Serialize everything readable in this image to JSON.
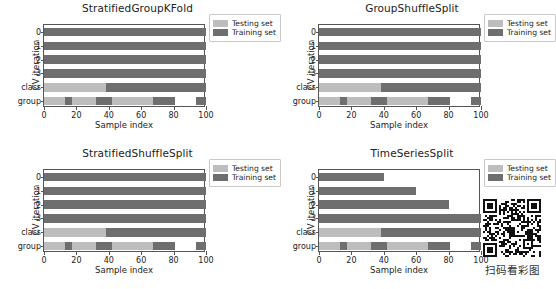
{
  "figure": {
    "background": "#ffffff",
    "colors": {
      "testing": "#bdbdbd",
      "training": "#6e6e6e",
      "axis": "#555555",
      "text": "#222222"
    },
    "legend": {
      "testing_label": "Testing set",
      "training_label": "Training set"
    },
    "axis": {
      "xlabel": "Sample index",
      "ylabel": "CV iteration",
      "xticks": [
        0,
        20,
        40,
        60,
        80,
        100
      ],
      "xticklabels": [
        "0",
        "20",
        "40",
        "60",
        "80",
        "100"
      ],
      "yticklabels": [
        "0",
        "1",
        "2",
        "3",
        "class",
        "group"
      ],
      "xlim": [
        0,
        100
      ]
    }
  },
  "chart_data": [
    {
      "type": "bar",
      "title": "StratifiedGroupKFold",
      "xlabel": "Sample index",
      "ylabel": "CV iteration",
      "xlim": [
        0,
        100
      ],
      "categories": [
        "0",
        "1",
        "2",
        "3",
        "class",
        "group"
      ],
      "rows": [
        {
          "label": "0",
          "segments": [
            {
              "start": 0,
              "end": 100,
              "kind": "train"
            }
          ]
        },
        {
          "label": "1",
          "segments": [
            {
              "start": 0,
              "end": 100,
              "kind": "train"
            }
          ]
        },
        {
          "label": "2",
          "segments": [
            {
              "start": 0,
              "end": 100,
              "kind": "train"
            }
          ]
        },
        {
          "label": "3",
          "segments": [
            {
              "start": 0,
              "end": 100,
              "kind": "train"
            }
          ]
        },
        {
          "label": "class",
          "segments": [
            {
              "start": 0,
              "end": 38,
              "kind": "test"
            },
            {
              "start": 38,
              "end": 100,
              "kind": "train"
            }
          ]
        },
        {
          "label": "group",
          "segments": [
            {
              "start": 0,
              "end": 13,
              "kind": "test"
            },
            {
              "start": 13,
              "end": 17,
              "kind": "train"
            },
            {
              "start": 17,
              "end": 32,
              "kind": "test"
            },
            {
              "start": 32,
              "end": 42,
              "kind": "train"
            },
            {
              "start": 42,
              "end": 67,
              "kind": "test"
            },
            {
              "start": 67,
              "end": 81,
              "kind": "train"
            },
            {
              "start": 81,
              "end": 94,
              "kind": "blank"
            },
            {
              "start": 94,
              "end": 100,
              "kind": "train"
            }
          ]
        }
      ]
    },
    {
      "type": "bar",
      "title": "GroupShuffleSplit",
      "xlabel": "Sample index",
      "ylabel": "CV iteration",
      "xlim": [
        0,
        100
      ],
      "categories": [
        "0",
        "1",
        "2",
        "3",
        "class",
        "group"
      ],
      "rows": [
        {
          "label": "0",
          "segments": [
            {
              "start": 0,
              "end": 100,
              "kind": "train"
            }
          ]
        },
        {
          "label": "1",
          "segments": [
            {
              "start": 0,
              "end": 100,
              "kind": "train"
            }
          ]
        },
        {
          "label": "2",
          "segments": [
            {
              "start": 0,
              "end": 100,
              "kind": "train"
            }
          ]
        },
        {
          "label": "3",
          "segments": [
            {
              "start": 0,
              "end": 100,
              "kind": "train"
            }
          ]
        },
        {
          "label": "class",
          "segments": [
            {
              "start": 0,
              "end": 38,
              "kind": "test"
            },
            {
              "start": 38,
              "end": 100,
              "kind": "train"
            }
          ]
        },
        {
          "label": "group",
          "segments": [
            {
              "start": 0,
              "end": 13,
              "kind": "test"
            },
            {
              "start": 13,
              "end": 17,
              "kind": "train"
            },
            {
              "start": 17,
              "end": 32,
              "kind": "test"
            },
            {
              "start": 32,
              "end": 42,
              "kind": "train"
            },
            {
              "start": 42,
              "end": 67,
              "kind": "test"
            },
            {
              "start": 67,
              "end": 81,
              "kind": "train"
            },
            {
              "start": 81,
              "end": 94,
              "kind": "blank"
            },
            {
              "start": 94,
              "end": 100,
              "kind": "train"
            }
          ]
        }
      ]
    },
    {
      "type": "bar",
      "title": "StratifiedShuffleSplit",
      "xlabel": "Sample index",
      "ylabel": "CV iteration",
      "xlim": [
        0,
        100
      ],
      "categories": [
        "0",
        "1",
        "2",
        "3",
        "class",
        "group"
      ],
      "rows": [
        {
          "label": "0",
          "segments": [
            {
              "start": 0,
              "end": 100,
              "kind": "train"
            }
          ]
        },
        {
          "label": "1",
          "segments": [
            {
              "start": 0,
              "end": 100,
              "kind": "train"
            }
          ]
        },
        {
          "label": "2",
          "segments": [
            {
              "start": 0,
              "end": 100,
              "kind": "train"
            }
          ]
        },
        {
          "label": "3",
          "segments": [
            {
              "start": 0,
              "end": 100,
              "kind": "train"
            }
          ]
        },
        {
          "label": "class",
          "segments": [
            {
              "start": 0,
              "end": 38,
              "kind": "test"
            },
            {
              "start": 38,
              "end": 100,
              "kind": "train"
            }
          ]
        },
        {
          "label": "group",
          "segments": [
            {
              "start": 0,
              "end": 13,
              "kind": "test"
            },
            {
              "start": 13,
              "end": 17,
              "kind": "train"
            },
            {
              "start": 17,
              "end": 32,
              "kind": "test"
            },
            {
              "start": 32,
              "end": 42,
              "kind": "train"
            },
            {
              "start": 42,
              "end": 67,
              "kind": "test"
            },
            {
              "start": 67,
              "end": 81,
              "kind": "train"
            },
            {
              "start": 81,
              "end": 94,
              "kind": "blank"
            },
            {
              "start": 94,
              "end": 100,
              "kind": "train"
            }
          ]
        }
      ]
    },
    {
      "type": "bar",
      "title": "TimeSeriesSplit",
      "xlabel": "Sample index",
      "ylabel": "CV iteration",
      "xlim": [
        0,
        100
      ],
      "categories": [
        "0",
        "1",
        "2",
        "3",
        "class",
        "group"
      ],
      "rows": [
        {
          "label": "0",
          "segments": [
            {
              "start": 0,
              "end": 40,
              "kind": "train"
            }
          ]
        },
        {
          "label": "1",
          "segments": [
            {
              "start": 0,
              "end": 60,
              "kind": "train"
            }
          ]
        },
        {
          "label": "2",
          "segments": [
            {
              "start": 0,
              "end": 80,
              "kind": "train"
            }
          ]
        },
        {
          "label": "3",
          "segments": [
            {
              "start": 0,
              "end": 100,
              "kind": "train"
            }
          ]
        },
        {
          "label": "class",
          "segments": [
            {
              "start": 0,
              "end": 38,
              "kind": "test"
            },
            {
              "start": 38,
              "end": 100,
              "kind": "train"
            }
          ]
        },
        {
          "label": "group",
          "segments": [
            {
              "start": 0,
              "end": 13,
              "kind": "test"
            },
            {
              "start": 13,
              "end": 17,
              "kind": "train"
            },
            {
              "start": 17,
              "end": 32,
              "kind": "test"
            },
            {
              "start": 32,
              "end": 42,
              "kind": "train"
            },
            {
              "start": 42,
              "end": 67,
              "kind": "test"
            },
            {
              "start": 67,
              "end": 81,
              "kind": "train"
            },
            {
              "start": 81,
              "end": 94,
              "kind": "blank"
            },
            {
              "start": 94,
              "end": 100,
              "kind": "train"
            }
          ]
        }
      ]
    }
  ],
  "qr": {
    "caption": "扫码看彩图",
    "modules": 29
  }
}
